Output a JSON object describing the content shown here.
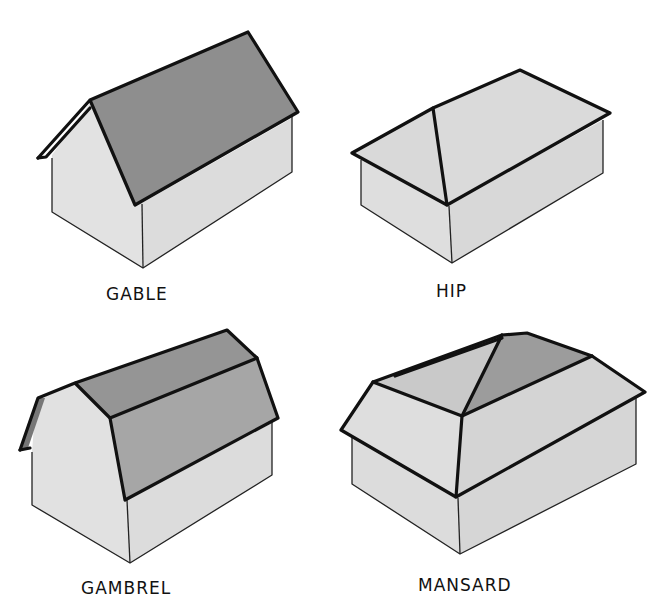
{
  "colors": {
    "background": "#ffffff",
    "wall_light": "#e3e3e3",
    "wall_side": "#dadada",
    "roof_dark": "#8f8f8f",
    "roof_medium": "#a9a9a9",
    "roof_light": "#d6d6d6",
    "outline": "#111111"
  },
  "roofs": [
    {
      "id": "gable",
      "label": "GABLE"
    },
    {
      "id": "hip",
      "label": "HIP"
    },
    {
      "id": "gambrel",
      "label": "GAMBREL"
    },
    {
      "id": "mansard",
      "label": "MANSARD"
    }
  ]
}
